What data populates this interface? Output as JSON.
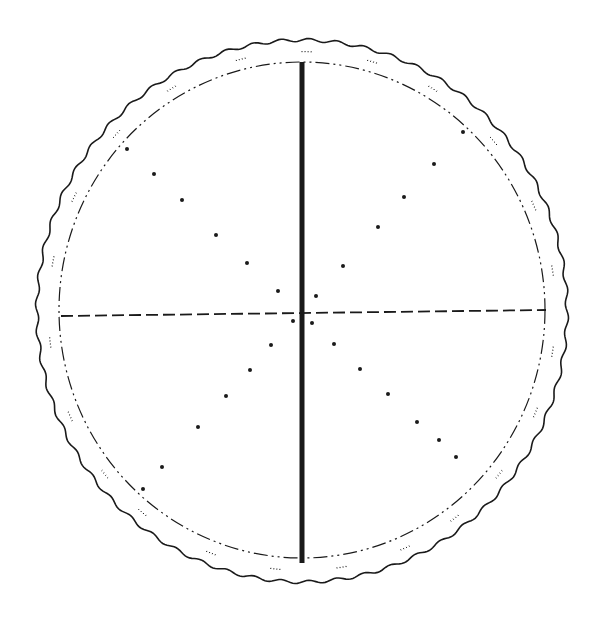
{
  "figure": {
    "width": 603,
    "height": 623,
    "background": "#ffffff",
    "ink": "#1a1a1a",
    "outer_circle": {
      "cx": 302,
      "cy": 311,
      "rx": 265,
      "ry": 271,
      "style": "wavy-solid"
    },
    "inner_circle": {
      "cx": 302,
      "cy": 310,
      "rx": 243,
      "ry": 248,
      "style": "dash-dot"
    },
    "vertical_bar": {
      "x": 302,
      "y1": 62,
      "y2": 563,
      "width": 5,
      "style": "solid-thick"
    },
    "horizontal_line": {
      "x1": 61,
      "y1": 316,
      "x2": 546,
      "y2": 310,
      "style": "dashed"
    },
    "dots": [
      {
        "x": 127,
        "y": 149
      },
      {
        "x": 154,
        "y": 174
      },
      {
        "x": 182,
        "y": 200
      },
      {
        "x": 216,
        "y": 235
      },
      {
        "x": 247,
        "y": 263
      },
      {
        "x": 278,
        "y": 291
      },
      {
        "x": 463,
        "y": 132
      },
      {
        "x": 434,
        "y": 164
      },
      {
        "x": 404,
        "y": 197
      },
      {
        "x": 378,
        "y": 227
      },
      {
        "x": 343,
        "y": 266
      },
      {
        "x": 316,
        "y": 296
      },
      {
        "x": 293,
        "y": 321
      },
      {
        "x": 312,
        "y": 323
      },
      {
        "x": 271,
        "y": 345
      },
      {
        "x": 250,
        "y": 370
      },
      {
        "x": 226,
        "y": 396
      },
      {
        "x": 198,
        "y": 427
      },
      {
        "x": 162,
        "y": 467
      },
      {
        "x": 143,
        "y": 489
      },
      {
        "x": 334,
        "y": 344
      },
      {
        "x": 360,
        "y": 369
      },
      {
        "x": 388,
        "y": 394
      },
      {
        "x": 417,
        "y": 422
      },
      {
        "x": 439,
        "y": 440
      },
      {
        "x": 456,
        "y": 457
      }
    ]
  }
}
